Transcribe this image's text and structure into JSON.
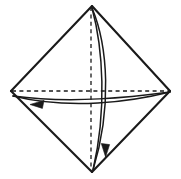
{
  "figure": {
    "type": "line-art-geometric-diagram",
    "background_color": "#ffffff",
    "stroke_color": "#1a1a1a",
    "canvas": {
      "width": 181,
      "height": 179
    },
    "vertices": {
      "top": {
        "x": 92,
        "y": 6,
        "label": "top-vertex"
      },
      "right": {
        "x": 170,
        "y": 91,
        "label": "right-vertex"
      },
      "bottom": {
        "x": 92,
        "y": 172,
        "label": "bottom-vertex"
      },
      "left": {
        "x": 11,
        "y": 91,
        "label": "left-vertex"
      }
    },
    "outline": {
      "name": "rhombus-outline",
      "stroke_width": 2.1,
      "edges": [
        {
          "from": "left",
          "to": "top"
        },
        {
          "from": "top",
          "to": "right"
        },
        {
          "from": "right",
          "to": "bottom"
        },
        {
          "from": "bottom",
          "to": "left"
        }
      ]
    },
    "axes": [
      {
        "name": "vertical-axis",
        "orientation": "vertical",
        "style": "dashed",
        "dash_pattern": "4,3.4",
        "stroke_width": 1.3,
        "from": {
          "x": 91,
          "y": 7
        },
        "to": {
          "x": 91,
          "y": 171
        }
      },
      {
        "name": "horizontal-axis",
        "orientation": "horizontal",
        "style": "dashed",
        "dash_pattern": "4,3.4",
        "stroke_width": 1.3,
        "from": {
          "x": 12,
          "y": 91
        },
        "to": {
          "x": 169,
          "y": 91
        }
      }
    ],
    "arcs": [
      {
        "name": "meridian-arc-vertical",
        "description": "narrow lens-shaped great circle through top and bottom vertices",
        "stroke_width": 1.5,
        "anchor_start": {
          "x": 92,
          "y": 8
        },
        "anchor_end": {
          "x": 93,
          "y": 170
        },
        "front_bulge_x": 108,
        "back_bulge_x": 103,
        "direction": "downward",
        "arrowhead": {
          "name": "arrowhead-down",
          "x": 105,
          "y": 150,
          "points_toward": "down",
          "size": 9
        }
      },
      {
        "name": "equator-arc-horizontal",
        "description": "flattened lens-shaped great circle through left and right vertices",
        "stroke_width": 1.5,
        "anchor_start": {
          "x": 170,
          "y": 92
        },
        "anchor_end": {
          "x": 13,
          "y": 95
        },
        "front_bulge_y": 107,
        "back_bulge_y": 100,
        "direction": "leftward",
        "arrowhead": {
          "name": "arrowhead-left",
          "x": 37,
          "y": 104,
          "points_toward": "left",
          "size": 9
        }
      }
    ]
  }
}
